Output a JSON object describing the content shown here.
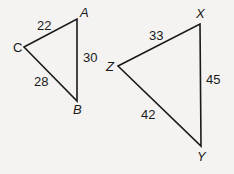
{
  "triangles": [
    {
      "name": "ABC",
      "vertices": {
        "A": {
          "label": "A",
          "x": 77,
          "y": 19
        },
        "B": {
          "label": "B",
          "x": 77,
          "y": 101
        },
        "C": {
          "label": "C",
          "x": 24,
          "y": 47
        }
      },
      "sides": {
        "CA": "22",
        "AB": "30",
        "CB": "28"
      }
    },
    {
      "name": "XYZ",
      "vertices": {
        "X": {
          "label": "X",
          "x": 200,
          "y": 24
        },
        "Y": {
          "label": "Y",
          "x": 201,
          "y": 146
        },
        "Z": {
          "label": "Z",
          "x": 118,
          "y": 66
        }
      },
      "sides": {
        "ZX": "33",
        "XY": "45",
        "ZY": "42"
      }
    }
  ],
  "colors": {
    "background": "#f4f3f1",
    "stroke": "#1a1a1a"
  }
}
